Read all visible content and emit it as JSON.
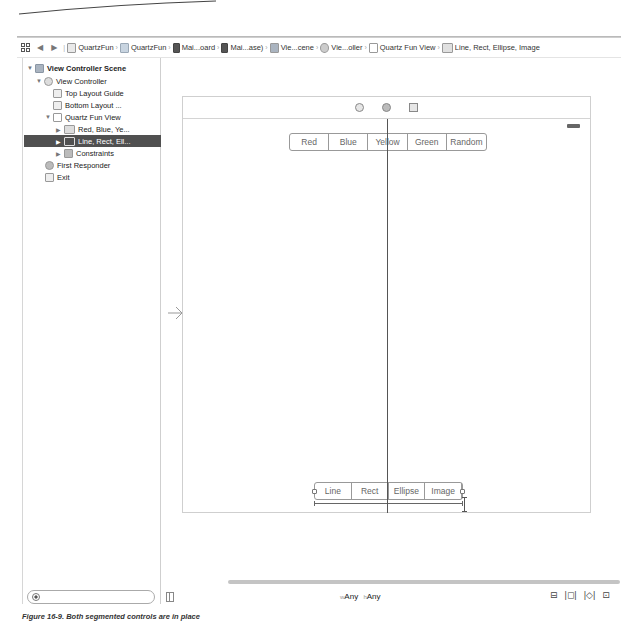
{
  "jumpbar": {
    "grid_icon": "related-items-grid-icon",
    "back_icon": "◀",
    "forward_icon": "▶",
    "breadcrumbs": [
      {
        "label": "QuartzFun",
        "icon": "project-icon"
      },
      {
        "label": "QuartzFun",
        "icon": "folder-icon"
      },
      {
        "label": "Mai...oard",
        "icon": "storyboard-file-icon"
      },
      {
        "label": "Mai...ase)",
        "icon": "storyboard-file-icon"
      },
      {
        "label": "Vie...cene",
        "icon": "scene-icon"
      },
      {
        "label": "Vie...oller",
        "icon": "view-controller-icon"
      },
      {
        "label": "Quartz Fun View",
        "icon": "view-icon"
      },
      {
        "label": "Line, Rect, Ellipse, Image",
        "icon": "segmented-control-icon"
      }
    ]
  },
  "outline": {
    "items": [
      {
        "label": "View Controller Scene",
        "disclosure": "▼",
        "icon": "scene-icon",
        "indent": 0,
        "bold": true,
        "selected": false
      },
      {
        "label": "View Controller",
        "disclosure": "▼",
        "icon": "view-controller-icon",
        "indent": 1,
        "bold": false,
        "selected": false
      },
      {
        "label": "Top Layout Guide",
        "disclosure": "",
        "icon": "layout-guide-icon",
        "indent": 2,
        "bold": false,
        "selected": false
      },
      {
        "label": "Bottom Layout ...",
        "disclosure": "",
        "icon": "layout-guide-icon",
        "indent": 2,
        "bold": false,
        "selected": false
      },
      {
        "label": "Quartz Fun View",
        "disclosure": "▼",
        "icon": "view-icon",
        "indent": 2,
        "bold": false,
        "selected": false
      },
      {
        "label": "Red, Blue, Ye...",
        "disclosure": "▶",
        "icon": "segmented-control-icon",
        "indent": 3,
        "bold": false,
        "selected": false
      },
      {
        "label": "Line, Rect, Ell...",
        "disclosure": "▶",
        "icon": "segmented-control-icon",
        "indent": 3,
        "bold": false,
        "selected": true
      },
      {
        "label": "Constraints",
        "disclosure": "▶",
        "icon": "constraints-icon",
        "indent": 3,
        "bold": false,
        "selected": false
      },
      {
        "label": "First Responder",
        "disclosure": "",
        "icon": "first-responder-icon",
        "indent": 1,
        "bold": false,
        "selected": false
      },
      {
        "label": "Exit",
        "disclosure": "",
        "icon": "exit-icon",
        "indent": 1,
        "bold": false,
        "selected": false
      }
    ],
    "filter_placeholder": ""
  },
  "canvas": {
    "entry_arrow": "→",
    "dock_icons": [
      "view-controller-icon",
      "first-responder-icon",
      "exit-icon"
    ],
    "color_segments": [
      "Red",
      "Blue",
      "Yellow",
      "Green",
      "Random"
    ],
    "shape_segments": [
      "Line",
      "Rect",
      "Ellipse",
      "Image"
    ]
  },
  "bottom_bar": {
    "size_class": {
      "w_prefix": "w",
      "w_value": "Any",
      "h_prefix": "h",
      "h_value": "Any"
    },
    "layout_tools": [
      "⊟",
      "|◻|",
      "|◇|",
      "⊡"
    ]
  },
  "caption": "Figure 16-9.  Both segmented controls are in place"
}
